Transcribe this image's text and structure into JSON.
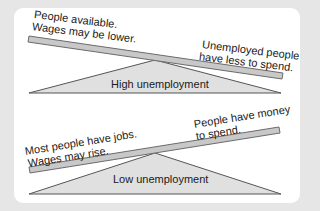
{
  "diagrams": [
    {
      "name": "high-unemployment",
      "label": "High unemployment",
      "left_text": [
        "People available.",
        "Wages may be lower."
      ],
      "right_text": [
        "Unemployed people",
        "have less to spend."
      ],
      "tilt": "down-right"
    },
    {
      "name": "low-unemployment",
      "label": "Low unemployment",
      "left_text": [
        "Most people have jobs.",
        "Wages may rise."
      ],
      "right_text": [
        "People have money",
        "to spend."
      ],
      "tilt": "up-right"
    }
  ],
  "colors": {
    "background": "#e6e6e6",
    "card": "#ffffff",
    "bar_fill": "#c8c8c8",
    "bar_stroke": "#6b6b6b",
    "fulcrum_fill": "#e0e0e0",
    "fulcrum_stroke": "#555555",
    "text": "#1a1a1a"
  }
}
